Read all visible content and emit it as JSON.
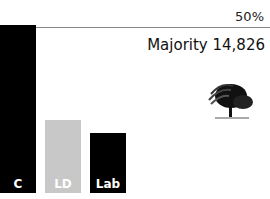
{
  "chart_data": {
    "type": "bar",
    "categories": [
      "C",
      "LD",
      "Lab"
    ],
    "values": [
      55,
      24,
      19
    ],
    "colors": [
      "#000000",
      "#c8c8c8",
      "#000000"
    ],
    "reference_line": {
      "label": "50%",
      "value": 50
    },
    "annotation": "Majority 14,826",
    "ylim": [
      0,
      60
    ]
  },
  "labels": {
    "pct": "50%",
    "majority": "Majority 14,826"
  },
  "bars": [
    {
      "label": "C",
      "color": "#000000",
      "left": 0,
      "height": 168
    },
    {
      "label": "LD",
      "color": "#c8c8c8",
      "left": 45,
      "height": 73
    },
    {
      "label": "Lab",
      "color": "#000000",
      "left": 90,
      "height": 60
    }
  ],
  "icon": "conservative-tree-icon"
}
